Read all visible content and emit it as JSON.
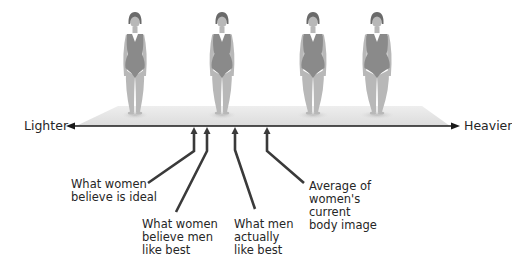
{
  "axis": {
    "left_label": "Lighter",
    "right_label": "Heavier"
  },
  "figures": [
    {
      "name": "figure-1-slimmest",
      "x": 135,
      "build": 1.0
    },
    {
      "name": "figure-2",
      "x": 222,
      "build": 1.08
    },
    {
      "name": "figure-3",
      "x": 313,
      "build": 1.2
    },
    {
      "name": "figure-4-heaviest",
      "x": 377,
      "build": 1.32
    }
  ],
  "markers": [
    {
      "name": "women-believe-ideal",
      "x": 194,
      "lines": [
        "What women",
        "believe is ideal"
      ]
    },
    {
      "name": "women-believe-men-like-best",
      "x": 207,
      "lines": [
        "What women",
        "believe men",
        "like best"
      ]
    },
    {
      "name": "men-actually-like-best",
      "x": 235,
      "lines": [
        "What men",
        "actually",
        "like best"
      ]
    },
    {
      "name": "average-current-body-image",
      "x": 267,
      "lines": [
        "Average of",
        "women's",
        "current",
        "body image"
      ]
    }
  ],
  "colors": {
    "swimsuit": "#8a8a8a",
    "skin": "#b8b8b8",
    "hair": "#6a6a6a",
    "platform": "#e4e4e4",
    "axis": "#1a1a1a",
    "leader": "#3a3a3a"
  }
}
